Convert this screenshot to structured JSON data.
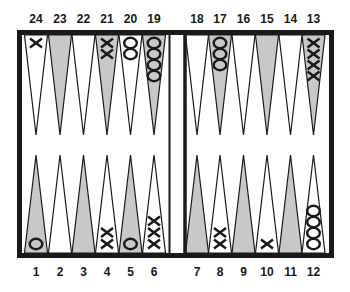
{
  "board": {
    "colors": {
      "frame": "#1a1a1a",
      "shaded_point": "#c8c8c8",
      "light_point": "#ffffff",
      "checker_stroke": "#1a1a1a"
    },
    "top_labels": [
      "24",
      "23",
      "22",
      "21",
      "20",
      "19",
      "18",
      "17",
      "16",
      "15",
      "14",
      "13"
    ],
    "bottom_labels": [
      "1",
      "2",
      "3",
      "4",
      "5",
      "6",
      "7",
      "8",
      "9",
      "10",
      "11",
      "12"
    ]
  },
  "points": [
    {
      "number": 1,
      "shaded": true,
      "checkers": {
        "type": "O",
        "count": 1
      }
    },
    {
      "number": 2,
      "shaded": false,
      "checkers": {
        "type": "",
        "count": 0
      }
    },
    {
      "number": 3,
      "shaded": true,
      "checkers": {
        "type": "",
        "count": 0
      }
    },
    {
      "number": 4,
      "shaded": false,
      "checkers": {
        "type": "X",
        "count": 2
      }
    },
    {
      "number": 5,
      "shaded": true,
      "checkers": {
        "type": "O",
        "count": 1
      }
    },
    {
      "number": 6,
      "shaded": false,
      "checkers": {
        "type": "X",
        "count": 3
      }
    },
    {
      "number": 7,
      "shaded": true,
      "checkers": {
        "type": "",
        "count": 0
      }
    },
    {
      "number": 8,
      "shaded": false,
      "checkers": {
        "type": "X",
        "count": 2
      }
    },
    {
      "number": 9,
      "shaded": true,
      "checkers": {
        "type": "",
        "count": 0
      }
    },
    {
      "number": 10,
      "shaded": false,
      "checkers": {
        "type": "X",
        "count": 1
      }
    },
    {
      "number": 11,
      "shaded": true,
      "checkers": {
        "type": "",
        "count": 0
      }
    },
    {
      "number": 12,
      "shaded": false,
      "checkers": {
        "type": "O",
        "count": 4
      }
    },
    {
      "number": 13,
      "shaded": true,
      "checkers": {
        "type": "X",
        "count": 4
      }
    },
    {
      "number": 14,
      "shaded": false,
      "checkers": {
        "type": "",
        "count": 0
      }
    },
    {
      "number": 15,
      "shaded": true,
      "checkers": {
        "type": "",
        "count": 0
      }
    },
    {
      "number": 16,
      "shaded": false,
      "checkers": {
        "type": "",
        "count": 0
      }
    },
    {
      "number": 17,
      "shaded": true,
      "checkers": {
        "type": "O",
        "count": 3
      }
    },
    {
      "number": 18,
      "shaded": false,
      "checkers": {
        "type": "",
        "count": 0
      }
    },
    {
      "number": 19,
      "shaded": true,
      "checkers": {
        "type": "O",
        "count": 4
      }
    },
    {
      "number": 20,
      "shaded": false,
      "checkers": {
        "type": "O",
        "count": 2
      }
    },
    {
      "number": 21,
      "shaded": true,
      "checkers": {
        "type": "X",
        "count": 2
      }
    },
    {
      "number": 22,
      "shaded": false,
      "checkers": {
        "type": "",
        "count": 0
      }
    },
    {
      "number": 23,
      "shaded": true,
      "checkers": {
        "type": "",
        "count": 0
      }
    },
    {
      "number": 24,
      "shaded": false,
      "checkers": {
        "type": "X",
        "count": 1
      }
    }
  ]
}
